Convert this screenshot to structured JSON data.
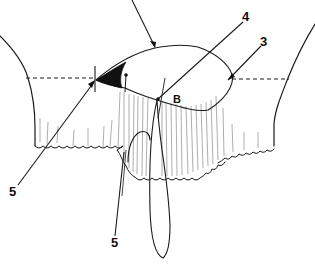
{
  "figure": {
    "type": "surgical line illustration",
    "colors": {
      "ink": "#1a1a1a",
      "background": "#ffffff",
      "hatching": "#777777"
    },
    "labels": [
      {
        "id": "label-4",
        "text": "4",
        "x": 242,
        "y": 21
      },
      {
        "id": "label-3",
        "text": "3",
        "x": 229,
        "y": 46
      },
      {
        "id": "label-B",
        "text": "B",
        "x": 170,
        "y": 106
      },
      {
        "id": "label-2",
        "text": "2",
        "x": 123,
        "y": 83
      },
      {
        "id": "label-5-left",
        "text": "5",
        "x": 8,
        "y": 192
      },
      {
        "id": "label-5-bottom",
        "text": "5",
        "x": 112,
        "y": 246
      }
    ]
  }
}
